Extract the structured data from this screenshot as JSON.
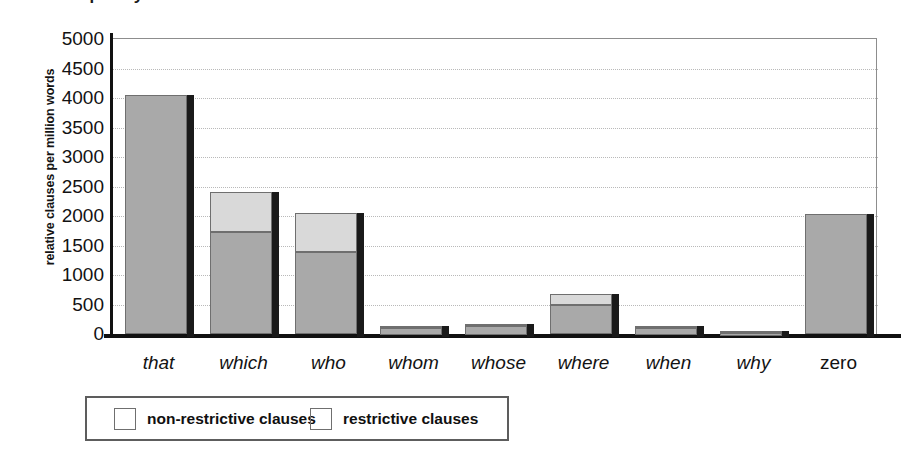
{
  "figure": {
    "title_partial": "frequency",
    "legend": {
      "items": [
        {
          "label": "non-restrictive clauses",
          "color": "#d9d9d9",
          "key": "non_restrictive"
        },
        {
          "label": "restrictive clauses",
          "color": "#a9a9a9",
          "key": "restrictive"
        }
      ]
    }
  },
  "chart_data": {
    "type": "bar",
    "stacked": true,
    "title": "",
    "xlabel": "",
    "ylabel": "relative clauses per million words",
    "ylim": [
      0,
      5000
    ],
    "ytick_step": 500,
    "ytick_labels": [
      "5000",
      "4500",
      "4000",
      "3500",
      "3000",
      "2500",
      "2000",
      "1500",
      "1000",
      "500",
      "0"
    ],
    "ytick_values": [
      5000,
      4500,
      4000,
      3500,
      3000,
      2500,
      2000,
      1500,
      1000,
      500,
      0
    ],
    "grid": true,
    "grid_axis": "y",
    "legend_position": "below-axes",
    "categories": [
      "that",
      "which",
      "who",
      "whom",
      "whose",
      "where",
      "when",
      "why",
      "zero"
    ],
    "category_styles": [
      "italic",
      "italic",
      "italic",
      "italic",
      "italic",
      "italic",
      "italic",
      "italic",
      "upright"
    ],
    "series": [
      {
        "name": "restrictive clauses",
        "color": "#a9a9a9",
        "values": [
          4050,
          1730,
          1390,
          120,
          140,
          490,
          120,
          50,
          2030
        ]
      },
      {
        "name": "non-restrictive clauses",
        "color": "#d9d9d9",
        "values": [
          0,
          670,
          660,
          20,
          25,
          190,
          10,
          5,
          0
        ]
      }
    ],
    "totals": [
      4050,
      2400,
      2050,
      140,
      165,
      680,
      130,
      55,
      2030
    ]
  }
}
